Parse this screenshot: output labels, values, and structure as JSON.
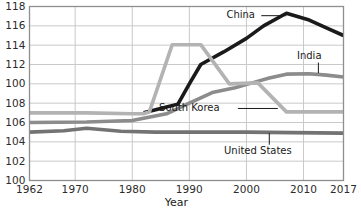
{
  "chart_data": {
    "type": "line",
    "title": "",
    "xlabel": "Year",
    "ylabel": "",
    "xlim": [
      1962,
      2017
    ],
    "ylim": [
      100,
      118
    ],
    "grid": true,
    "legend_position": "inline-annotations",
    "x_tick_labels": [
      "1962",
      "1970",
      "1980",
      "1990",
      "2000",
      "2010",
      "2017"
    ],
    "x_ticks": [
      1962,
      1970,
      1980,
      1990,
      2000,
      2010,
      2017
    ],
    "y_tick_labels": [
      "100",
      "102",
      "104",
      "106",
      "108",
      "100",
      "112",
      "114",
      "116",
      "118"
    ],
    "y_ticks": [
      100,
      102,
      104,
      106,
      108,
      110,
      112,
      114,
      116,
      118
    ],
    "series": [
      {
        "name": "China",
        "color": "#1a1a1a",
        "width": 3.6,
        "label_x": 1999,
        "label_y": 117.2,
        "leader": {
          "type": "horizontal",
          "from_x": 2002.6,
          "to_x": 2007.0,
          "y": 117.05
        },
        "x": [
          1982,
          1986,
          1988,
          1990,
          1992,
          1996,
          2000,
          2003,
          2007,
          2011,
          2014,
          2017
        ],
        "values": [
          107.0,
          107.6,
          107.9,
          110.0,
          112.0,
          113.3,
          114.7,
          116.0,
          117.3,
          116.6,
          115.8,
          115.0
        ]
      },
      {
        "name": "India",
        "color": "#8c8c8c",
        "width": 3.6,
        "label_x": 2011,
        "label_y": 112.9,
        "leader": {
          "type": "vertical",
          "x": 2012.6,
          "from_y": 112.2,
          "to_y": 111.1
        },
        "x": [
          1962,
          1972,
          1980,
          1986,
          1990,
          1994,
          1998,
          2001,
          2004,
          2007,
          2011,
          2014,
          2017
        ],
        "values": [
          106.0,
          106.05,
          106.2,
          106.9,
          108.0,
          109.1,
          109.6,
          110.1,
          110.6,
          111.0,
          111.05,
          110.9,
          110.7
        ]
      },
      {
        "name": "South Korea",
        "color": "#b3b3b3",
        "width": 3.6,
        "label_x": 1990,
        "label_y": 107.6,
        "leader": {
          "type": "horizontal",
          "from_x": 1998.5,
          "to_x": 2005.5,
          "y": 107.45
        },
        "x": [
          1962,
          1972,
          1980,
          1982,
          1983,
          1987,
          1992,
          1997,
          2002,
          2007,
          2012,
          2017
        ],
        "values": [
          107.0,
          107.0,
          106.9,
          106.9,
          107.1,
          114.05,
          114.05,
          110.0,
          110.1,
          107.1,
          107.1,
          107.1
        ]
      },
      {
        "name": "United States",
        "color": "#737373",
        "width": 3.6,
        "label_x": 2002,
        "label_y": 103.1,
        "leader": {
          "type": "vertical",
          "x": 2004.0,
          "from_y": 103.7,
          "to_y": 104.9
        },
        "x": [
          1962,
          1968,
          1972,
          1978,
          1984,
          1992,
          2000,
          2008,
          2017
        ],
        "values": [
          105.0,
          105.15,
          105.4,
          105.1,
          105.0,
          105.0,
          105.0,
          104.95,
          104.9
        ]
      }
    ]
  },
  "axes": {
    "x_title": "Year"
  },
  "style": {
    "plot_border_color": "#8f8f8f",
    "grid_color": "#c9c9c9",
    "background": "#ffffff",
    "tick_text_color": "#2b2b2b"
  }
}
